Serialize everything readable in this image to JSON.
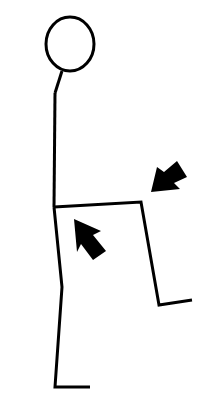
{
  "figure": {
    "colors": {
      "background": "#ffffff",
      "stroke": "#000000"
    },
    "head": {
      "cx": 70,
      "cy": 44,
      "rx": 24,
      "ry": 27
    },
    "neck": [
      [
        62,
        71
      ],
      [
        55,
        93
      ]
    ],
    "body": [
      [
        55,
        93
      ],
      [
        54,
        207
      ]
    ],
    "standing_leg": [
      [
        54,
        207
      ],
      [
        62,
        287
      ],
      [
        55,
        387
      ],
      [
        90,
        387
      ]
    ],
    "raised_leg": [
      [
        54,
        207
      ],
      [
        141,
        202
      ],
      [
        159,
        305
      ],
      [
        192,
        300
      ]
    ],
    "arrows": [
      {
        "name": "arrow-knee",
        "points": [
          [
            151,
            192
          ],
          [
            157,
            167
          ],
          [
            164,
            172
          ],
          [
            177,
            161
          ],
          [
            187,
            177
          ],
          [
            174,
            183
          ],
          [
            180,
            189
          ]
        ]
      },
      {
        "name": "arrow-thigh",
        "points": [
          [
            74,
            219
          ],
          [
            101,
            231
          ],
          [
            93,
            235
          ],
          [
            106,
            251
          ],
          [
            93,
            260
          ],
          [
            81,
            244
          ],
          [
            77,
            252
          ]
        ]
      }
    ]
  }
}
